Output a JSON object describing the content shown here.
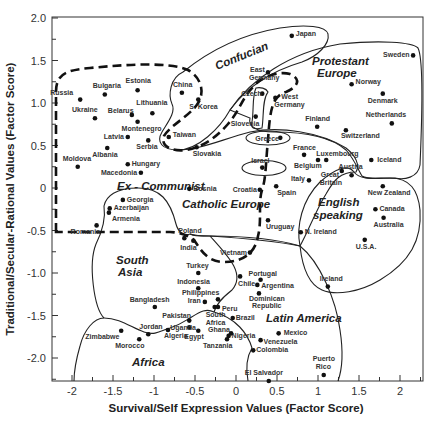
{
  "chart_data": {
    "type": "scatter",
    "title": "",
    "xlabel": "Survival/Self Expression Values (Factor Score)",
    "ylabel": "Traditional/Secular-Rational Values (Factor Score)",
    "xlim": [
      -2.2,
      2.27
    ],
    "ylim": [
      -2.27,
      2.0
    ],
    "x_ticks": [
      "-2",
      "-1.5",
      "-1",
      "-0.5",
      "0",
      "0.5",
      "1",
      "1.5",
      "2"
    ],
    "y_ticks": [
      "2.0",
      "1.5",
      "1.0",
      "0.5",
      "0",
      "-0.5",
      "-1.0",
      "-1.5",
      "-2.0"
    ],
    "grid": false,
    "legend": "none",
    "regions": [
      {
        "name": "Confucian",
        "style": "solid"
      },
      {
        "name": "Protestant Europe",
        "style": "solid"
      },
      {
        "name": "Ex - Communist",
        "style": "dashed"
      },
      {
        "name": "Catholic Europe",
        "style": "solid"
      },
      {
        "name": "English speaking",
        "style": "solid"
      },
      {
        "name": "South Asia",
        "style": "solid"
      },
      {
        "name": "Latin America",
        "style": "solid"
      },
      {
        "name": "Africa",
        "style": "solid"
      }
    ],
    "points": [
      {
        "label": "Russia",
        "x": -1.9,
        "y": 1.04,
        "lx": -30,
        "ly": -5
      },
      {
        "label": "Bulgaria",
        "x": -1.6,
        "y": 1.1,
        "lx": -12,
        "ly": -7
      },
      {
        "label": "Estonia",
        "x": -1.2,
        "y": 1.15,
        "lx": -12,
        "ly": -7
      },
      {
        "label": "Ukraine",
        "x": -1.72,
        "y": 0.82,
        "lx": -23,
        "ly": -6
      },
      {
        "label": "Belarus",
        "x": -1.27,
        "y": 0.86,
        "lx": -24,
        "ly": -2
      },
      {
        "label": "Lithuania",
        "x": -1.02,
        "y": 0.88,
        "lx": -16,
        "ly": -8
      },
      {
        "label": "Montenegro",
        "x": -1.2,
        "y": 0.78,
        "lx": -16,
        "ly": 9
      },
      {
        "label": "Latvia",
        "x": -1.32,
        "y": 0.6,
        "lx": -24,
        "ly": 2
      },
      {
        "label": "Serbia",
        "x": -1.07,
        "y": 0.56,
        "lx": -12,
        "ly": 9
      },
      {
        "label": "Albania",
        "x": -1.57,
        "y": 0.47,
        "lx": -15,
        "ly": 9
      },
      {
        "label": "Moldova",
        "x": -1.93,
        "y": 0.25,
        "lx": -15,
        "ly": -6
      },
      {
        "label": "Hungary",
        "x": -1.32,
        "y": 0.28,
        "lx": 4,
        "ly": 2
      },
      {
        "label": "Macedonia",
        "x": -1.16,
        "y": 0.18,
        "lx": -40,
        "ly": 2
      },
      {
        "label": "Bosnia",
        "x": -0.57,
        "y": -0.01,
        "lx": 4,
        "ly": 2
      },
      {
        "label": "Georgia",
        "x": -1.38,
        "y": -0.14,
        "lx": 4,
        "ly": 2
      },
      {
        "label": "Azerbaijan",
        "x": -1.54,
        "y": -0.24,
        "lx": 4,
        "ly": 2
      },
      {
        "label": "Armenia",
        "x": -1.55,
        "y": -0.29,
        "lx": 3,
        "ly": 8
      },
      {
        "label": "Romania",
        "x": -1.7,
        "y": -0.44,
        "lx": -26,
        "ly": 9
      },
      {
        "label": "China",
        "x": -0.66,
        "y": 1.12,
        "lx": -9,
        "ly": -6
      },
      {
        "label": "S. Korea",
        "x": -0.46,
        "y": 1.04,
        "lx": -9,
        "ly": 9
      },
      {
        "label": "Taiwan",
        "x": -0.82,
        "y": 0.6,
        "lx": 4,
        "ly": 0
      },
      {
        "label": "Slovakia",
        "x": -0.48,
        "y": 0.48,
        "lx": -4,
        "ly": 9
      },
      {
        "label": "Japan",
        "x": 0.68,
        "y": 1.79,
        "lx": 4,
        "ly": 0
      },
      {
        "label": "East",
        "x": 0.39,
        "y": 1.36,
        "lx": -18,
        "ly": 0
      },
      {
        "label": "Germany",
        "x": 0.39,
        "y": 1.36,
        "lx": -19,
        "ly": 8
      },
      {
        "label": "Czech",
        "x": 0.32,
        "y": 1.11,
        "lx": -21,
        "ly": 2
      },
      {
        "label": "West",
        "x": 0.48,
        "y": 1.06,
        "lx": 6,
        "ly": 1
      },
      {
        "label": "Germany",
        "x": 0.48,
        "y": 1.06,
        "lx": -1,
        "ly": 9
      },
      {
        "label": "Slovenia",
        "x": 0.24,
        "y": 0.84,
        "lx": -25,
        "ly": 9
      },
      {
        "label": "Greece",
        "x": 0.54,
        "y": 0.59,
        "lx": -25,
        "ly": 3
      },
      {
        "label": "Israel",
        "x": 0.32,
        "y": 0.24,
        "lx": -11,
        "ly": -5
      },
      {
        "label": "Croatia",
        "x": 0.29,
        "y": -0.02,
        "lx": -27,
        "ly": 2
      },
      {
        "label": "Spain",
        "x": 0.49,
        "y": 0.02,
        "lx": 1,
        "ly": 9
      },
      {
        "label": "Uruguay",
        "x": 0.39,
        "y": -0.38,
        "lx": -2,
        "ly": 9
      },
      {
        "label": "Italy",
        "x": 0.89,
        "y": 0.09,
        "lx": -18,
        "ly": 1
      },
      {
        "label": "France",
        "x": 0.83,
        "y": 0.39,
        "lx": -11,
        "ly": -5
      },
      {
        "label": "Belgium",
        "x": 1.0,
        "y": 0.33,
        "lx": -24,
        "ly": 8
      },
      {
        "label": "Luxembourg",
        "x": 1.1,
        "y": 0.33,
        "lx": -10,
        "ly": -4
      },
      {
        "label": "Austria",
        "x": 1.41,
        "y": 0.15,
        "lx": -13,
        "ly": -6
      },
      {
        "label": "Great",
        "x": 1.29,
        "y": 0.2,
        "lx": -21,
        "ly": 6
      },
      {
        "label": "Britain",
        "x": 1.29,
        "y": 0.2,
        "lx": -22,
        "ly": 14
      },
      {
        "label": "Iceland",
        "x": 1.65,
        "y": 0.33,
        "lx": 6,
        "ly": 2
      },
      {
        "label": "Sweden",
        "x": 2.16,
        "y": 1.56,
        "lx": -30,
        "ly": 2
      },
      {
        "label": "Norway",
        "x": 1.41,
        "y": 1.22,
        "lx": 4,
        "ly": 0
      },
      {
        "label": "Denmark",
        "x": 1.79,
        "y": 1.11,
        "lx": -15,
        "ly": 9
      },
      {
        "label": "Netherlands",
        "x": 1.9,
        "y": 0.76,
        "lx": -26,
        "ly": -6
      },
      {
        "label": "Finland",
        "x": 0.99,
        "y": 0.72,
        "lx": -12,
        "ly": -6
      },
      {
        "label": "Switzerland",
        "x": 1.34,
        "y": 0.68,
        "lx": -5,
        "ly": 8
      },
      {
        "label": "New Zealand",
        "x": 1.79,
        "y": 0.02,
        "lx": -15,
        "ly": 9
      },
      {
        "label": "Canada",
        "x": 1.7,
        "y": -0.25,
        "lx": 4,
        "ly": 2
      },
      {
        "label": "Australia",
        "x": 1.8,
        "y": -0.35,
        "lx": -10,
        "ly": 9
      },
      {
        "label": "U.S.A.",
        "x": 1.57,
        "y": -0.61,
        "lx": -9,
        "ly": 9
      },
      {
        "label": "N. Ireland",
        "x": 0.79,
        "y": -0.52,
        "lx": 4,
        "ly": 2
      },
      {
        "label": "Ireland",
        "x": 1.12,
        "y": -1.16,
        "lx": -8,
        "ly": -6
      },
      {
        "label": "Poland",
        "x": -0.63,
        "y": -0.59,
        "lx": -6,
        "ly": -5
      },
      {
        "label": "India",
        "x": -0.52,
        "y": -0.62,
        "lx": -13,
        "ly": 9
      },
      {
        "label": "Vietnam",
        "x": 0.17,
        "y": -0.76,
        "lx": -30,
        "ly": 2
      },
      {
        "label": "Turkey",
        "x": -0.46,
        "y": -1.0,
        "lx": -12,
        "ly": -5
      },
      {
        "label": "Indonesia",
        "x": -0.46,
        "y": -1.18,
        "lx": -21,
        "ly": -4
      },
      {
        "label": "Philippines",
        "x": -0.22,
        "y": -1.31,
        "lx": -36,
        "ly": -4
      },
      {
        "label": "Iran",
        "x": -0.38,
        "y": -1.34,
        "lx": -17,
        "ly": 1
      },
      {
        "label": "Bangladesh",
        "x": -0.99,
        "y": -1.4,
        "lx": -25,
        "ly": -5
      },
      {
        "label": "Pakistan",
        "x": -0.57,
        "y": -1.56,
        "lx": -27,
        "ly": -3
      },
      {
        "label": "South",
        "x": -0.26,
        "y": -1.4,
        "lx": -9,
        "ly": 10
      },
      {
        "label": "Africa",
        "x": -0.26,
        "y": -1.4,
        "lx": -9,
        "ly": 18
      },
      {
        "label": "Peru",
        "x": -0.22,
        "y": -1.4,
        "lx": 4,
        "ly": 4
      },
      {
        "label": "Chile",
        "x": 0.05,
        "y": -1.04,
        "lx": -2,
        "ly": 10
      },
      {
        "label": "Portugal",
        "x": 0.3,
        "y": -1.08,
        "lx": -12,
        "ly": -4
      },
      {
        "label": "Argentina",
        "x": 0.26,
        "y": -1.14,
        "lx": 4,
        "ly": 3
      },
      {
        "label": "Dominican",
        "x": 0.28,
        "y": -1.24,
        "lx": -10,
        "ly": 8
      },
      {
        "label": "Republic",
        "x": 0.28,
        "y": -1.24,
        "lx": -7,
        "ly": 15
      },
      {
        "label": "Brazil",
        "x": -0.04,
        "y": -1.53,
        "lx": 3,
        "ly": 2
      },
      {
        "label": "Mexico",
        "x": 0.52,
        "y": -1.71,
        "lx": 5,
        "ly": 2
      },
      {
        "label": "Venezuela",
        "x": 0.3,
        "y": -1.79,
        "lx": 3,
        "ly": 4
      },
      {
        "label": "Colombia",
        "x": 0.21,
        "y": -1.91,
        "lx": 3,
        "ly": 2
      },
      {
        "label": "Nigeria",
        "x": -0.09,
        "y": -1.74,
        "lx": 3,
        "ly": 2
      },
      {
        "label": "Ghana",
        "x": -0.06,
        "y": -1.71,
        "lx": -23,
        "ly": -1
      },
      {
        "label": "Tanzania",
        "x": -0.11,
        "y": -1.78,
        "lx": -24,
        "ly": 9
      },
      {
        "label": "Uganda",
        "x": -0.57,
        "y": -1.64,
        "lx": -19,
        "ly": 3
      },
      {
        "label": "Egypt",
        "x": -0.46,
        "y": -1.68,
        "lx": -14,
        "ly": 8
      },
      {
        "label": "Algeria",
        "x": -0.83,
        "y": -1.67,
        "lx": -4,
        "ly": 8
      },
      {
        "label": "Jordan",
        "x": -1.07,
        "y": -1.72,
        "lx": -9,
        "ly": -5
      },
      {
        "label": "Zimbabwe",
        "x": -1.4,
        "y": -1.68,
        "lx": -36,
        "ly": 8
      },
      {
        "label": "Morocco",
        "x": -1.18,
        "y": -1.78,
        "lx": -24,
        "ly": 9
      },
      {
        "label": "El Salvador",
        "x": 0.4,
        "y": -2.27,
        "lx": -24,
        "ly": -6
      },
      {
        "label": "Puerto",
        "x": 1.07,
        "y": -2.2,
        "lx": -11,
        "ly": -14
      },
      {
        "label": "Rico",
        "x": 1.07,
        "y": -2.2,
        "lx": -8,
        "ly": -6
      }
    ]
  },
  "region_labels": {
    "confucian": "Confucian",
    "protestant_1": "Protestant",
    "protestant_2": "Europe",
    "ex_communist": "Ex - Communist",
    "catholic": "Catholic  Europe",
    "english_1": "English",
    "english_2": "speaking",
    "south_asia_1": "South",
    "south_asia_2": "Asia",
    "latin_america": "Latin America",
    "africa": "Africa"
  }
}
